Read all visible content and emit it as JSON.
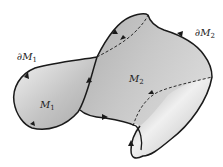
{
  "figure": {
    "colors": {
      "background": "#ffffff",
      "surface_fill": "#bdbdbd",
      "surface_light": "#ebebeb",
      "outline": "#1a1a1a"
    }
  },
  "labels": {
    "boundary_m1": {
      "base": "∂M",
      "sub": "1"
    },
    "surface_m1": {
      "base": "M",
      "sub": "1"
    },
    "surface_m2": {
      "base": "M",
      "sub": "2"
    },
    "boundary_m2": {
      "base": "∂M",
      "sub": "2"
    }
  }
}
